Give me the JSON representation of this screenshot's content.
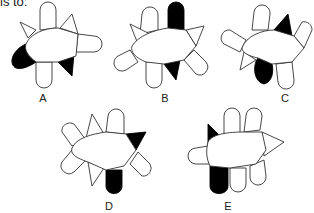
{
  "prompt": {
    "text": "is to:"
  },
  "options": [
    {
      "label": "A",
      "x": 43,
      "y": 92
    },
    {
      "label": "B",
      "x": 165,
      "y": 92
    },
    {
      "label": "C",
      "x": 285,
      "y": 92
    },
    {
      "label": "D",
      "x": 109,
      "y": 200
    },
    {
      "label": "E",
      "x": 228,
      "y": 200
    }
  ],
  "colors": {
    "stroke": "#333333",
    "fill_shaded": "#000000",
    "fill_plain": "#ffffff"
  }
}
